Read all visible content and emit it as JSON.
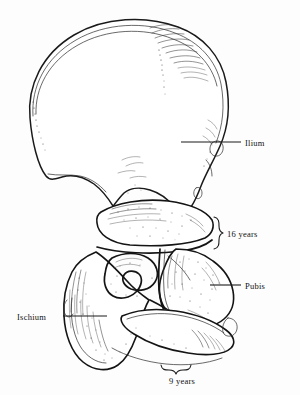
{
  "figure": {
    "background_color": "#fdfdfd",
    "ink_color": "#1a1a1a",
    "width": 300,
    "height": 395
  },
  "labels": {
    "ilium": "Ilium",
    "pubis": "Pubis",
    "ischium": "Ischium",
    "fusion_16": "16 years",
    "fusion_9": "9 years"
  },
  "annotations": [
    {
      "name": "ilium",
      "text": "Ilium",
      "kind": "leader-label",
      "text_x": 245,
      "text_y": 147,
      "leader_from": [
        181,
        142
      ],
      "leader_to": [
        241,
        142
      ]
    },
    {
      "name": "pubis",
      "text": "Pubis",
      "kind": "leader-label",
      "text_x": 245,
      "text_y": 289,
      "leader_from": [
        210,
        285
      ],
      "leader_to": [
        241,
        285
      ]
    },
    {
      "name": "ischium",
      "text": "Ischium",
      "kind": "leader-label",
      "text_x": 18,
      "text_y": 320,
      "leader_from": [
        63,
        316
      ],
      "leader_to": [
        105,
        316
      ]
    },
    {
      "name": "fusion-16-years",
      "text": "16 years",
      "kind": "brace-label",
      "orientation": "vertical",
      "text_x": 228,
      "text_y": 240,
      "brace_top": 218,
      "brace_bottom": 258,
      "brace_x": 217
    },
    {
      "name": "fusion-9-years",
      "text": "9 years",
      "kind": "brace-label",
      "orientation": "horizontal",
      "text_x": 190,
      "text_y": 381,
      "brace_left": 163,
      "brace_right": 210,
      "brace_y": 368
    }
  ]
}
